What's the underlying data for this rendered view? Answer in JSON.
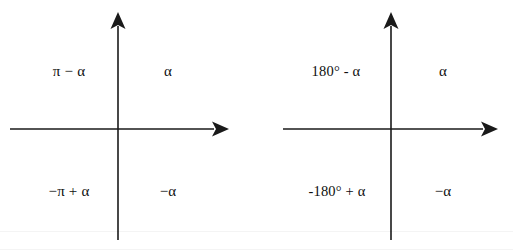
{
  "figure": {
    "background_color": "#ffffff",
    "stroke_color": "#1a1a1a",
    "text_color": "#0e0e0e",
    "panels": [
      {
        "id": "radians-diagram",
        "name": "radian-measure-quadrant-diagram",
        "axes": {
          "x_axis_label": "",
          "y_axis_label": "",
          "origin_x": 118,
          "origin_y": 129,
          "x_arrow_direction": "right",
          "y_arrow_direction": "up"
        },
        "labels": [
          {
            "quadrant": "I",
            "text": "α",
            "x": 168,
            "y": 71
          },
          {
            "quadrant": "II",
            "text": "π − α",
            "x": 69,
            "y": 71
          },
          {
            "quadrant": "III",
            "text": "−π + α",
            "x": 69,
            "y": 191
          },
          {
            "quadrant": "IV",
            "text": "−α",
            "x": 168,
            "y": 191
          }
        ]
      },
      {
        "id": "degrees-diagram",
        "name": "degree-measure-quadrant-diagram",
        "axes": {
          "x_axis_label": "",
          "y_axis_label": "",
          "origin_x": 391,
          "origin_y": 129,
          "x_arrow_direction": "right",
          "y_arrow_direction": "up"
        },
        "labels": [
          {
            "quadrant": "I",
            "text": "α",
            "x": 443,
            "y": 71
          },
          {
            "quadrant": "II",
            "text": "180° - α",
            "x": 336,
            "y": 71
          },
          {
            "quadrant": "III",
            "text": "-180° + α",
            "x": 337,
            "y": 191
          },
          {
            "quadrant": "IV",
            "text": "−α",
            "x": 443,
            "y": 191
          }
        ]
      }
    ]
  }
}
